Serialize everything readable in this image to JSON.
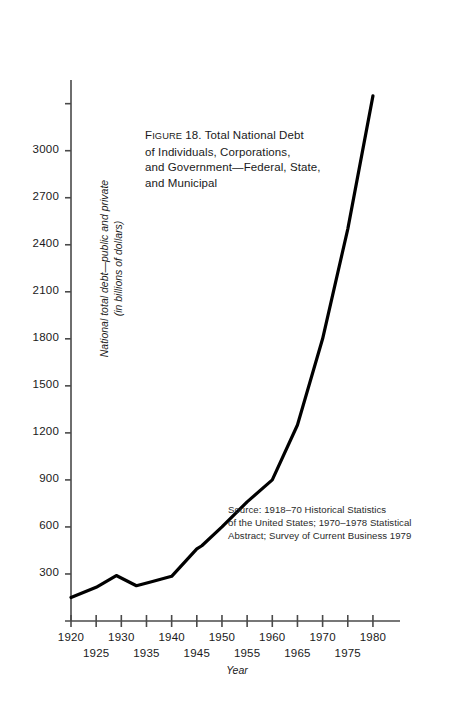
{
  "chart_data": {
    "type": "line",
    "title": "Figure 18.  Total National Debt\nof Individuals, Corporations,\nand Government—Federal, State,\nand Municipal",
    "title_figure_word": "Figure",
    "xlabel": "Year",
    "ylabel": "National total debt—public and private\n(in billions of dollars)",
    "source": "Source:    1918–70 Historical Statistics\nof the United States; 1970–1978 Statistical\nAbstract; Survey of Current Business 1979",
    "xlim": [
      1920,
      1982
    ],
    "ylim": [
      0,
      3400
    ],
    "grid": false,
    "legend": null,
    "line_color": "#000000",
    "axis_color": "#4a4a4a",
    "x_ticks": [
      1920,
      1925,
      1930,
      1935,
      1940,
      1945,
      1950,
      1955,
      1960,
      1965,
      1970,
      1975,
      1980
    ],
    "x_tick_labels_upper": [
      {
        "value": 1920,
        "label": "1920"
      },
      {
        "value": 1930,
        "label": "1930"
      },
      {
        "value": 1940,
        "label": "1940"
      },
      {
        "value": 1950,
        "label": "1950"
      },
      {
        "value": 1960,
        "label": "1960"
      },
      {
        "value": 1970,
        "label": "1970"
      },
      {
        "value": 1980,
        "label": "1980"
      }
    ],
    "x_tick_labels_lower": [
      {
        "value": 1925,
        "label": "1925"
      },
      {
        "value": 1935,
        "label": "1935"
      },
      {
        "value": 1945,
        "label": "1945"
      },
      {
        "value": 1955,
        "label": "1955"
      },
      {
        "value": 1965,
        "label": "1965"
      },
      {
        "value": 1975,
        "label": "1975"
      }
    ],
    "y_ticks": [
      300,
      600,
      900,
      1200,
      1500,
      1800,
      2100,
      2400,
      2700,
      3000
    ],
    "y_tick_labels": [
      "300",
      "600",
      "900",
      "1200",
      "1500",
      "1800",
      "2100",
      "2400",
      "2700",
      "3000"
    ],
    "y_minor_ticks": [
      3300
    ],
    "series": [
      {
        "name": "National total debt—public and private",
        "x": [
          1920,
          1925,
          1929,
          1933,
          1936,
          1940,
          1945,
          1946,
          1950,
          1955,
          1960,
          1965,
          1970,
          1975,
          1980
        ],
        "values": [
          150,
          215,
          290,
          225,
          250,
          285,
          460,
          480,
          600,
          760,
          900,
          1250,
          1800,
          2500,
          3350
        ]
      }
    ]
  }
}
